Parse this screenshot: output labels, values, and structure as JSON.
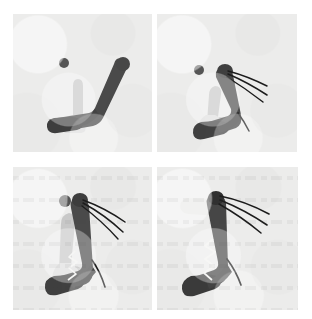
{
  "figure": {
    "type": "motion-sequence-figure",
    "layout": "2x2 grid of frames",
    "frame_count": 4,
    "colors": {
      "page_background": "#ffffff",
      "panel_background": "#ececeb",
      "limb_dark": "#4a4a4a",
      "limb_dark_edge": "#3a3a3a",
      "limb_ghost": "#c8c8c8",
      "limb_ghost_light": "#dedede",
      "head_light": "#e4e4e2",
      "ball": "#555555",
      "trace_line": "#1c1c1c",
      "zigzag": "#f2f2f0"
    },
    "panels": [
      {
        "id": "panel-1",
        "index": 1,
        "caption": "",
        "description": "bent limb leaning right, ball at upper left, no motion traces",
        "has_ball": true,
        "ball": {
          "cx": 51,
          "cy": 49,
          "r": 5
        },
        "has_traces": false,
        "trace_count": 0,
        "posture": "crouched",
        "has_zigzag": false
      },
      {
        "id": "panel-2",
        "index": 2,
        "caption": "",
        "description": "limb rising toward vertical, three motion traces fan from top, ball upper left",
        "has_ball": true,
        "ball": {
          "cx": 42,
          "cy": 56,
          "r": 5
        },
        "has_traces": true,
        "trace_count": 3,
        "posture": "rising",
        "has_zigzag": false
      },
      {
        "id": "panel-3",
        "index": 3,
        "caption": "",
        "description": "near vertical posture, ball close to head, three motion traces plus trailing curve",
        "has_ball": true,
        "ball": {
          "cx": 52,
          "cy": 34,
          "r": 6
        },
        "has_traces": true,
        "trace_count": 3,
        "posture": "upright",
        "has_zigzag": true
      },
      {
        "id": "panel-4",
        "index": 4,
        "caption": "",
        "description": "ball merged with head forming pale snout, three motion traces, white zigzag on limb",
        "has_ball": false,
        "ball": null,
        "has_traces": true,
        "trace_count": 3,
        "posture": "contact",
        "has_zigzag": true
      }
    ]
  }
}
